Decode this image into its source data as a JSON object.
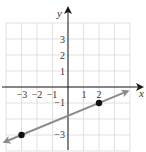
{
  "chart_data": {
    "type": "line",
    "title": "",
    "xlabel": "x",
    "ylabel": "y",
    "xlim": [
      -4,
      4
    ],
    "ylim": [
      -4,
      4
    ],
    "grid": true,
    "x_tick_labels": [
      "-3",
      "-2",
      "-1",
      "1",
      "2"
    ],
    "x_tick_values": [
      -3,
      -2,
      -1,
      1,
      2
    ],
    "y_tick_labels": [
      "3",
      "2",
      "1",
      "-1",
      "-3"
    ],
    "y_tick_values": [
      3,
      2,
      1,
      -1,
      -3
    ],
    "points": [
      {
        "x": -3,
        "y": -3
      },
      {
        "x": 2,
        "y": -1
      }
    ],
    "line": {
      "slope": 0.4,
      "intercept": -1.8,
      "x_start": -4.1,
      "x_end": 3.85,
      "color": "#8c8c8c",
      "arrows": "both"
    }
  },
  "labels": {
    "x_axis": "x",
    "y_axis": "y",
    "x_ticks": [
      "−3",
      "−2",
      "−1",
      "1",
      "2"
    ],
    "y_ticks": [
      "3",
      "2",
      "1",
      "−1",
      "−3"
    ]
  }
}
